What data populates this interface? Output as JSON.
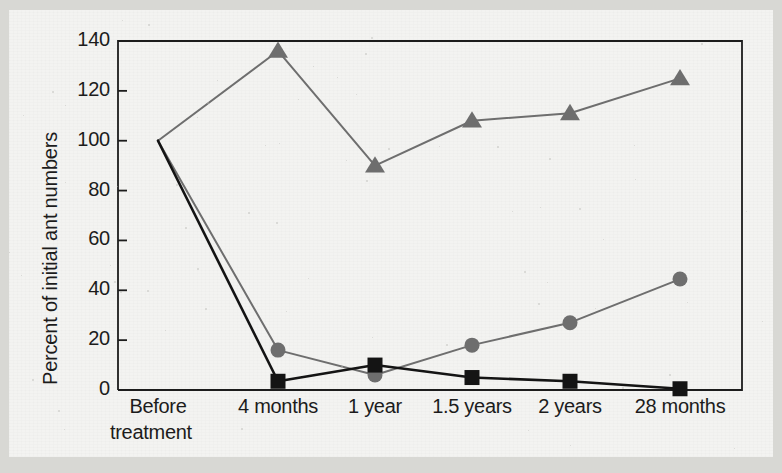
{
  "figure": {
    "background_color": "#d8d8d4",
    "paper_color": "#f3f3f1",
    "axis_color": "#1c1c1c"
  },
  "chart_data": {
    "type": "line",
    "title": "",
    "xlabel": "",
    "ylabel": "Percent of initial ant numbers",
    "categories": [
      "Before\ntreatment",
      "4 months",
      "1 year",
      "1.5 years",
      "2 years",
      "28 months"
    ],
    "category_labels": [
      [
        "Before",
        "treatment"
      ],
      [
        "4 months"
      ],
      [
        "1 year"
      ],
      [
        "1.5 years"
      ],
      [
        "2 years"
      ],
      [
        "28 months"
      ]
    ],
    "ylim": [
      0,
      140
    ],
    "yticks": [
      0,
      20,
      40,
      60,
      80,
      100,
      120,
      140
    ],
    "ytick_labels": [
      "0",
      "20",
      "40",
      "60",
      "80",
      "100",
      "120",
      "140"
    ],
    "grid": false,
    "legend": "none",
    "series": [
      {
        "name": "gray-triangle-series",
        "marker": "triangle",
        "color": "#6e6e6e",
        "line_color": "#6e6e6e",
        "line_width": 2,
        "values": [
          100,
          136,
          90,
          108,
          111,
          125
        ]
      },
      {
        "name": "gray-circle-series",
        "marker": "circle",
        "color": "#6e6e6e",
        "line_color": "#6e6e6e",
        "line_width": 2,
        "values": [
          100,
          16,
          6,
          18,
          27,
          44.5
        ]
      },
      {
        "name": "black-square-series",
        "marker": "square",
        "color": "#141414",
        "line_color": "#141414",
        "line_width": 2.6,
        "values": [
          100,
          3.5,
          10,
          5,
          3.5,
          0.5
        ]
      }
    ]
  }
}
